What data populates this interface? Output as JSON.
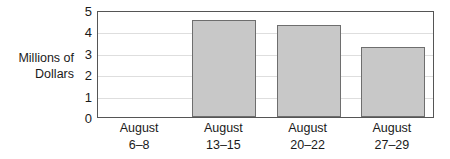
{
  "chart_data": {
    "type": "bar",
    "title": "",
    "xlabel": "",
    "ylabel": "Millions of\nDollars",
    "ylim": [
      0,
      5
    ],
    "yticks": [
      0,
      1,
      2,
      3,
      4,
      5
    ],
    "ytick_labels": [
      "0",
      "1",
      "2",
      "3",
      "4",
      "5"
    ],
    "grid": true,
    "legend": false,
    "categories": [
      "August\n6–8",
      "August\n13–15",
      "August\n20–22",
      "August\n27–29"
    ],
    "category_lines": [
      [
        "August",
        "6–8"
      ],
      [
        "August",
        "13–15"
      ],
      [
        "August",
        "20–22"
      ],
      [
        "August",
        "27–29"
      ]
    ],
    "values": [
      0,
      4.55,
      4.3,
      3.25
    ],
    "bar_color": "#c8c8c8",
    "bar_edge_color": "#6e6e6e",
    "grid_color": "#dedede",
    "axis_color": "#555555",
    "text_color": "#1a1a1a"
  }
}
